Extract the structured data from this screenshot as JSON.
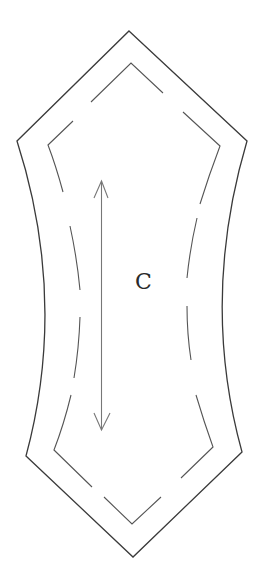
{
  "diagram": {
    "type": "sewing-pattern-piece",
    "piece_label": "C",
    "colors": {
      "background": "#ffffff",
      "cut_line": "#3a3a3a",
      "seam_line": "#555555",
      "grainline": "#777777",
      "label": "#2a2a2a"
    },
    "cut_line": {
      "description": "solid outer cutting line",
      "top_tip": [
        129,
        31
      ],
      "upper_left": [
        17,
        141
      ],
      "upper_right": [
        247,
        141
      ],
      "waist_left": [
        58,
        300
      ],
      "waist_right": [
        212,
        300
      ],
      "lower_left": [
        26,
        456
      ],
      "lower_right": [
        242,
        452
      ],
      "bottom_tip": [
        133,
        557
      ]
    },
    "seam_line": {
      "description": "dashed inner stitching line",
      "top_tip": [
        131,
        63
      ],
      "upper_left": [
        48,
        145
      ],
      "upper_right": [
        220,
        146
      ],
      "lower_left": [
        54,
        450
      ],
      "lower_right": [
        213,
        447
      ],
      "bottom_tip": [
        132,
        524
      ]
    },
    "grainline": {
      "description": "double-headed grainline arrow",
      "start": [
        101,
        181
      ],
      "end": [
        102,
        430
      ]
    }
  }
}
